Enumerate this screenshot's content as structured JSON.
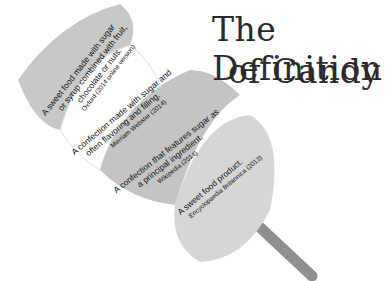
{
  "title": {
    "line1": "The Definition",
    "line2": "of Candy"
  },
  "segments": [
    {
      "definition_line1": "A sweet food made with sugar",
      "definition_line2": "or syrup combined with fruit,",
      "definition_line3": "chocolate or nuts.",
      "source": "Oxford (2014 online version)",
      "color": "#c8c8c8"
    },
    {
      "definition_line1": "A confection made with sugar and",
      "definition_line2": "often flavoring and filling.",
      "source": "Merriam Webster (2014)",
      "color": "#ffffff"
    },
    {
      "definition_line1": "A confection that features sugar as",
      "definition_line2": "a principal ingredient.",
      "source": "Wikipedia (2014)",
      "color": "#c4c4c4"
    },
    {
      "definition_line1": "A sweet food product.",
      "source": "Encyclopaedia Britannica (2013)",
      "color": "#d6d6d6"
    }
  ],
  "stick_color": "#8f8f8f"
}
